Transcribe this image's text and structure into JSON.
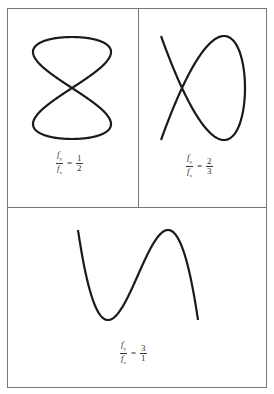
{
  "figure": {
    "panels": [
      {
        "id": "panel-1-2",
        "ratio_label": {
          "num_var": "f",
          "num_sub": "y",
          "den_var": "f",
          "den_sub": "x",
          "eq": "=",
          "value_num": "1",
          "value_den": "2"
        },
        "curve": "lissajous fy:fx = 1:2"
      },
      {
        "id": "panel-2-3",
        "ratio_label": {
          "num_var": "f",
          "num_sub": "y",
          "den_var": "f",
          "den_sub": "x",
          "eq": "=",
          "value_num": "2",
          "value_den": "3"
        },
        "curve": "lissajous fy:fx = 2:3"
      },
      {
        "id": "panel-3-1",
        "ratio_label": {
          "num_var": "f",
          "num_sub": "y",
          "den_var": "f",
          "den_sub": "x",
          "eq": "=",
          "value_num": "3",
          "value_den": "1"
        },
        "curve": "lissajous fy:fx = 3:1"
      }
    ],
    "stroke_color": "#1a1a1a",
    "border_color": "#777777"
  }
}
